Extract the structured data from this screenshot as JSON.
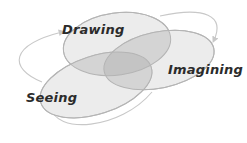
{
  "diagram": {
    "type": "venn-cycle",
    "nodes": [
      {
        "id": "drawing",
        "label": "Drawing"
      },
      {
        "id": "imagining",
        "label": "Imagining"
      },
      {
        "id": "seeing",
        "label": "Seeing"
      }
    ],
    "cycle": [
      "seeing",
      "drawing",
      "imagining",
      "seeing"
    ],
    "colors": {
      "ellipse_fill": "#ececec",
      "ellipse_stroke": "#b8b8b8",
      "overlap_fill": "#cfcfcf",
      "center_fill": "#c2c2c2",
      "arrow_stroke": "#c8c8c8",
      "text": "#2b2b2b"
    }
  }
}
